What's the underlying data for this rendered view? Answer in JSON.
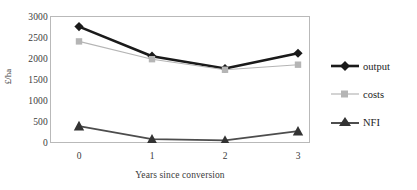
{
  "figure": {
    "caption_remnant": "",
    "background": "#ffffff"
  },
  "axes": {
    "y_title": "£/ha",
    "x_title": "Years since conversion",
    "frame_color": "#b9b9b9"
  },
  "legend": {
    "items": [
      {
        "label": "output",
        "marker": "diamond",
        "color": "#1a1a1a",
        "line_width": 2.6
      },
      {
        "label": "costs",
        "marker": "square",
        "color": "#b5b5b5",
        "line_width": 1.1
      },
      {
        "label": "NFI",
        "marker": "triangle",
        "color": "#4d4d4d",
        "line_width": 1.8
      }
    ]
  },
  "chart_data": {
    "type": "line",
    "title": "",
    "xlabel": "Years since conversion",
    "ylabel": "£/ha",
    "categories": [
      "0",
      "1",
      "2",
      "3"
    ],
    "x": [
      0,
      1,
      2,
      3
    ],
    "ylim": [
      0,
      3000
    ],
    "yticks": [
      0,
      500,
      1000,
      1500,
      2000,
      2500,
      3000
    ],
    "ytick_labels": [
      "0",
      "500",
      "1000",
      "1500",
      "2000",
      "2500",
      "3000"
    ],
    "grid": false,
    "legend_position": "right",
    "series": [
      {
        "name": "output",
        "values": [
          2750,
          2050,
          1760,
          2120
        ],
        "color": "#1a1a1a",
        "marker": "diamond"
      },
      {
        "name": "costs",
        "values": [
          2400,
          1980,
          1730,
          1850
        ],
        "color": "#b5b5b5",
        "marker": "square"
      },
      {
        "name": "NFI",
        "values": [
          400,
          90,
          60,
          280
        ],
        "color": "#4d4d4d",
        "marker": "triangle"
      }
    ]
  }
}
